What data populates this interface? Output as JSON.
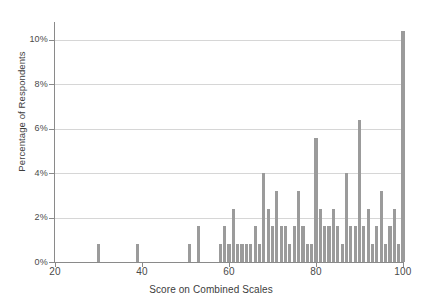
{
  "chart_data": {
    "type": "bar",
    "title": "",
    "xlabel": "Score on Combined Scales",
    "ylabel": "Percentage of Respondents",
    "xlim": [
      18,
      102
    ],
    "ylim": [
      0,
      10.8
    ],
    "xticks": [
      20,
      40,
      60,
      80,
      100
    ],
    "xtick_labels": [
      "20",
      "40",
      "60",
      "80",
      "100"
    ],
    "yticks": [
      0,
      2,
      4,
      6,
      8,
      10
    ],
    "ytick_labels": [
      "0%",
      "2%",
      "4%",
      "6%",
      "8%",
      "10%"
    ],
    "grid": "horizontal",
    "legend": "none",
    "bar_color": "#9b9b9b",
    "x": [
      30,
      39,
      51,
      53,
      58,
      59,
      60,
      61,
      62,
      63,
      64,
      65,
      66,
      67,
      68,
      69,
      70,
      71,
      72,
      73,
      74,
      75,
      76,
      77,
      78,
      79,
      80,
      81,
      82,
      83,
      84,
      85,
      86,
      87,
      88,
      89,
      90,
      91,
      92,
      93,
      94,
      95,
      96,
      97,
      98,
      99,
      100
    ],
    "values": [
      0.8,
      0.8,
      0.8,
      1.6,
      0.8,
      1.6,
      0.8,
      2.4,
      0.8,
      0.8,
      0.8,
      0.8,
      1.6,
      0.8,
      4.0,
      2.4,
      1.6,
      3.2,
      1.6,
      1.6,
      0.8,
      1.6,
      3.2,
      1.6,
      0.8,
      0.8,
      5.6,
      2.4,
      1.6,
      1.6,
      2.4,
      1.6,
      0.8,
      4.0,
      1.6,
      1.6,
      6.4,
      1.6,
      2.4,
      0.8,
      1.6,
      3.2,
      0.8,
      1.6,
      2.4,
      0.8,
      10.4
    ],
    "categories": [
      "30",
      "39",
      "51",
      "53",
      "58",
      "59",
      "60",
      "61",
      "62",
      "63",
      "64",
      "65",
      "66",
      "67",
      "68",
      "69",
      "70",
      "71",
      "72",
      "73",
      "74",
      "75",
      "76",
      "77",
      "78",
      "79",
      "80",
      "81",
      "82",
      "83",
      "84",
      "85",
      "86",
      "87",
      "88",
      "89",
      "90",
      "91",
      "92",
      "93",
      "94",
      "95",
      "96",
      "97",
      "98",
      "99",
      "100"
    ]
  }
}
